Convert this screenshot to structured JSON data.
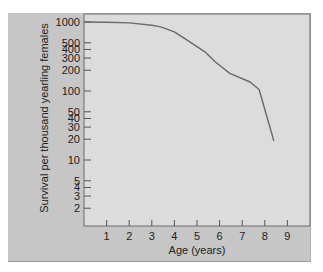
{
  "chart_data": {
    "type": "line",
    "title": "",
    "xlabel": "Age (years)",
    "ylabel": "Survival per thousand yearling females",
    "yscale": "log",
    "xlim": [
      0,
      10
    ],
    "ylim": [
      1,
      1000
    ],
    "x_ticks": [
      1,
      2,
      3,
      4,
      5,
      6,
      7,
      8,
      9
    ],
    "y_ticks": [
      1000,
      500,
      400,
      300,
      200,
      100,
      50,
      40,
      30,
      20,
      10,
      5,
      4,
      3,
      2
    ],
    "grid": false,
    "legend": null,
    "series": [
      {
        "name": "Survivorship",
        "x": [
          0,
          1,
          2,
          3,
          3.4,
          4.0,
          4.7,
          5.35,
          5.8,
          6.45,
          7.35,
          7.75,
          8.4
        ],
        "values": [
          1000,
          990,
          970,
          900,
          850,
          720,
          510,
          370,
          265,
          180,
          135,
          105,
          19
        ]
      }
    ]
  },
  "colors": {
    "panel": "#c6c6c6",
    "plot_area": "#dcdcdc",
    "line": "#6a6a6a",
    "axis": "#555555"
  }
}
